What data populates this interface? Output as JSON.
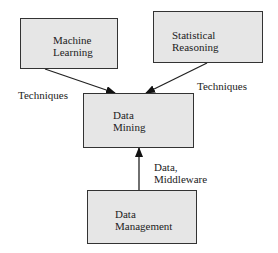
{
  "diagram": {
    "nodes": [
      {
        "id": "ml",
        "line1": "Machine",
        "line2": "Learning"
      },
      {
        "id": "sr",
        "line1": "Statistical",
        "line2": "Reasoning"
      },
      {
        "id": "dm",
        "line1": "Data",
        "line2": "Mining"
      },
      {
        "id": "dmg",
        "line1": "Data",
        "line2": "Management"
      }
    ],
    "edges": [
      {
        "from": "ml",
        "to": "dm",
        "label": "Techniques"
      },
      {
        "from": "sr",
        "to": "dm",
        "label": "Techniques"
      },
      {
        "from": "dmg",
        "to": "dm",
        "label_line1": "Data,",
        "label_line2": "Middleware"
      }
    ]
  }
}
